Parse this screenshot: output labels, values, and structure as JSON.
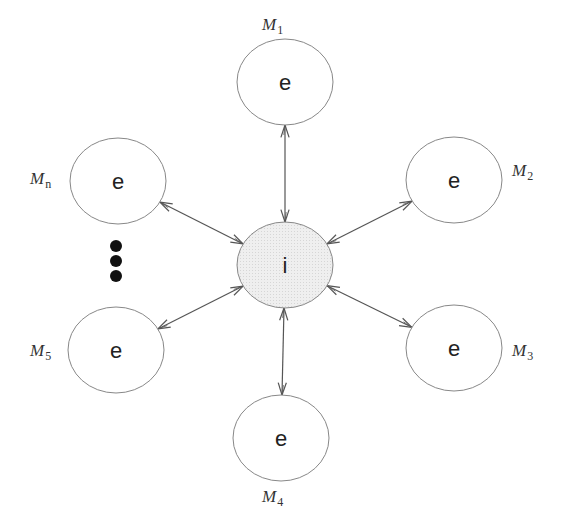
{
  "diagram": {
    "type": "star-topology",
    "center": {
      "id": "center",
      "label": "i",
      "fill": "#ededed",
      "stroke": "#888888"
    },
    "outer_fill": "#ffffff",
    "outer_stroke": "#888888",
    "edge_color": "#555555",
    "edge_style": "bidirectional-arrow",
    "nodes": [
      {
        "id": "M1",
        "label": "e",
        "name_main": "M",
        "name_sub": "1",
        "direction": "top"
      },
      {
        "id": "M2",
        "label": "e",
        "name_main": "M",
        "name_sub": "2",
        "direction": "upper-right"
      },
      {
        "id": "M3",
        "label": "e",
        "name_main": "M",
        "name_sub": "3",
        "direction": "lower-right"
      },
      {
        "id": "M4",
        "label": "e",
        "name_main": "M",
        "name_sub": "4",
        "direction": "bottom"
      },
      {
        "id": "M5",
        "label": "e",
        "name_main": "M",
        "name_sub": "5",
        "direction": "lower-left"
      },
      {
        "id": "Mn",
        "label": "e",
        "name_main": "M",
        "name_sub": "n",
        "direction": "upper-left"
      }
    ],
    "ellipsis": {
      "between": [
        "Mn",
        "M5"
      ],
      "count": 3,
      "color": "#111111"
    }
  }
}
